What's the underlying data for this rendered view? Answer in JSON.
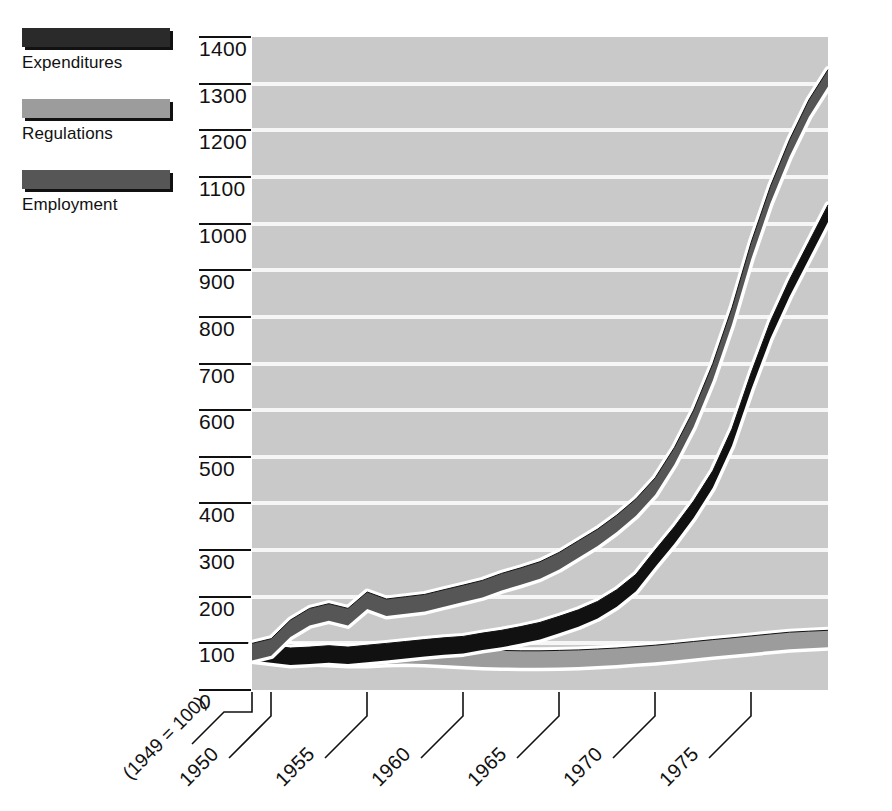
{
  "chart_data": {
    "type": "area",
    "title": "",
    "subtitle": "",
    "xlabel": "",
    "ylabel": "",
    "note": "(1949 = 100)",
    "index_base_year": 1949,
    "index_base_value": 100,
    "ylim": [
      0,
      1400
    ],
    "y_ticks": [
      0,
      100,
      200,
      300,
      400,
      500,
      600,
      700,
      800,
      900,
      1000,
      1100,
      1200,
      1300,
      1400
    ],
    "y_tick_labels": [
      "0",
      "100",
      "200",
      "300",
      "400",
      "500",
      "600",
      "700",
      "800",
      "900",
      "1000",
      "1100",
      "1200",
      "1300",
      "1400"
    ],
    "xlim": [
      1949,
      1979
    ],
    "x_ticks": [
      1950,
      1955,
      1960,
      1965,
      1970,
      1975
    ],
    "x_tick_labels": [
      "1950",
      "1955",
      "1960",
      "1965",
      "1970",
      "1975"
    ],
    "grid": "horizontal",
    "legend_position": "top-left",
    "plot_background": "#c9c9c9",
    "gridline_color": "#f6f6f6",
    "band_outline_color": "#ffffff",
    "x": [
      1949,
      1950,
      1951,
      1952,
      1953,
      1954,
      1955,
      1956,
      1957,
      1958,
      1959,
      1960,
      1961,
      1962,
      1963,
      1964,
      1965,
      1966,
      1967,
      1968,
      1969,
      1970,
      1971,
      1972,
      1973,
      1974,
      1975,
      1976,
      1977,
      1978,
      1979
    ],
    "series": [
      {
        "name": "Expenditures",
        "color": "#111111",
        "values": [
          100,
          95,
          90,
          92,
          95,
          92,
          96,
          100,
          104,
          108,
          112,
          115,
          122,
          128,
          136,
          145,
          158,
          172,
          190,
          215,
          248,
          300,
          350,
          405,
          470,
          560,
          680,
          790,
          880,
          960,
          1040
        ]
      },
      {
        "name": "Regulations",
        "color": "#9c9c9c",
        "values": [
          100,
          98,
          96,
          94,
          92,
          90,
          90,
          92,
          93,
          92,
          90,
          88,
          86,
          85,
          84,
          84,
          85,
          86,
          88,
          90,
          93,
          96,
          100,
          104,
          108,
          112,
          116,
          120,
          124,
          126,
          128
        ]
      },
      {
        "name": "Employment",
        "color": "#565656",
        "values": [
          100,
          110,
          150,
          175,
          185,
          175,
          210,
          195,
          200,
          205,
          215,
          225,
          235,
          250,
          262,
          275,
          295,
          320,
          345,
          375,
          410,
          455,
          520,
          600,
          700,
          820,
          960,
          1080,
          1180,
          1265,
          1330
        ]
      }
    ]
  },
  "legend": {
    "entries": [
      {
        "label": "Expenditures",
        "color": "#2a2a2a"
      },
      {
        "label": "Regulations",
        "color": "#9c9c9c"
      },
      {
        "label": "Employment",
        "color": "#565656"
      }
    ]
  }
}
